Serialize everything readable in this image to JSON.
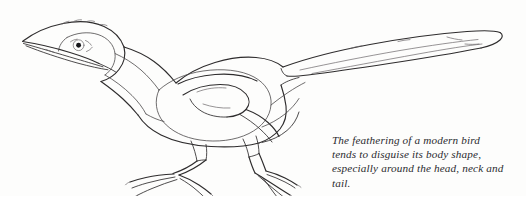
{
  "figure": {
    "kind": "line-drawing-illustration",
    "alt": "Pen-and-ink side view drawing of a long-tailed modern bird, with an inner contour line indicating the skinny body beneath the feathers",
    "background_color": "#fdfdfc",
    "ink_color": "#2e2c2d"
  },
  "caption": {
    "lines": [
      "The feathering of a modern bird",
      "tends to disguise its body shape,",
      "especially around the head, neck and",
      "tail."
    ],
    "full_text": "The feathering of a modern bird tends to disguise its body shape, especially around the head, neck and tail.",
    "style": "italic serif",
    "color": "#2b2b2f"
  },
  "parts": {
    "beak": "beak",
    "eye": "eye",
    "head": "head",
    "neck": "neck",
    "body": "body",
    "wing": "wing",
    "tail": "tail",
    "leg_front": "front leg",
    "leg_rear": "rear leg",
    "foot_front": "front foot",
    "foot_rear": "rear foot"
  }
}
